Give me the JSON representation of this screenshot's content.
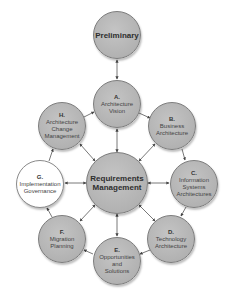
{
  "diagram": {
    "colors": {
      "phase_fill": "#b5b5b5",
      "phase_border": "#7c7c7c",
      "highlight_fill": "#ffffff",
      "arrow": "#444444"
    },
    "nodes": {
      "preliminary": {
        "title": "Preliminary"
      },
      "a": {
        "letter": "A.",
        "line1": "Architecture",
        "line2": "Vision"
      },
      "b": {
        "letter": "B.",
        "line1": "Business",
        "line2": "Architecture"
      },
      "c": {
        "letter": "C.",
        "line1": "Information",
        "line2": "Systems",
        "line3": "Architectures"
      },
      "d": {
        "letter": "D.",
        "line1": "Technology",
        "line2": "Architecture"
      },
      "e": {
        "letter": "E.",
        "line1": "Opportunities",
        "line2": "and",
        "line3": "Solutions"
      },
      "f": {
        "letter": "F.",
        "line1": "Migration",
        "line2": "Planning"
      },
      "g": {
        "letter": "G.",
        "line1": "Implementation",
        "line2": "Governance"
      },
      "h": {
        "letter": "H.",
        "line1": "Architecture",
        "line2": "Change",
        "line3": "Management"
      },
      "center": {
        "line1": "Requirements",
        "line2": "Management"
      }
    },
    "edges": [
      {
        "from": "preliminary",
        "to": "a",
        "type": "bidirectional"
      },
      {
        "from": "a",
        "to": "b",
        "type": "directed"
      },
      {
        "from": "b",
        "to": "c",
        "type": "directed"
      },
      {
        "from": "c",
        "to": "d",
        "type": "directed"
      },
      {
        "from": "d",
        "to": "e",
        "type": "directed"
      },
      {
        "from": "e",
        "to": "f",
        "type": "directed"
      },
      {
        "from": "f",
        "to": "g",
        "type": "directed"
      },
      {
        "from": "g",
        "to": "h",
        "type": "directed"
      },
      {
        "from": "h",
        "to": "a",
        "type": "directed"
      },
      {
        "from": "center",
        "to": "a",
        "type": "bidirectional"
      },
      {
        "from": "center",
        "to": "b",
        "type": "bidirectional"
      },
      {
        "from": "center",
        "to": "c",
        "type": "bidirectional"
      },
      {
        "from": "center",
        "to": "d",
        "type": "bidirectional"
      },
      {
        "from": "center",
        "to": "e",
        "type": "bidirectional"
      },
      {
        "from": "center",
        "to": "f",
        "type": "bidirectional"
      },
      {
        "from": "center",
        "to": "g",
        "type": "bidirectional"
      },
      {
        "from": "center",
        "to": "h",
        "type": "bidirectional"
      }
    ]
  }
}
